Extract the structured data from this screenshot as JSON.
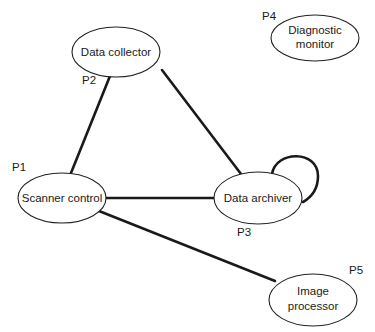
{
  "diagram": {
    "type": "process-communication-graph",
    "nodes": [
      {
        "id": "P1",
        "process_label": "P1",
        "name_lines": [
          "Scanner control"
        ]
      },
      {
        "id": "P2",
        "process_label": "P2",
        "name_lines": [
          "Data collector"
        ]
      },
      {
        "id": "P3",
        "process_label": "P3",
        "name_lines": [
          "Data archiver"
        ]
      },
      {
        "id": "P4",
        "process_label": "P4",
        "name_lines": [
          "Diagnostic",
          "monitor"
        ]
      },
      {
        "id": "P5",
        "process_label": "P5",
        "name_lines": [
          "Image",
          "processor"
        ]
      }
    ],
    "edges": [
      {
        "from": "P2",
        "to": "P1"
      },
      {
        "from": "P2",
        "to": "P3"
      },
      {
        "from": "P1",
        "to": "P3"
      },
      {
        "from": "P1",
        "to": "P5"
      },
      {
        "from": "P3",
        "to": "P3",
        "self_loop": true
      }
    ]
  }
}
